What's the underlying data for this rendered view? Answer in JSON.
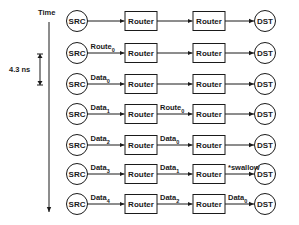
{
  "diagram": {
    "time_axis": {
      "label": "Time"
    },
    "interval": {
      "label": "4.3 ns"
    },
    "node_labels": {
      "src": "SRC",
      "router": "Router",
      "dst": "DST"
    },
    "rows": [
      {
        "edges": [
          {
            "label": "",
            "sub": ""
          },
          {
            "label": "",
            "sub": ""
          },
          {
            "label": "",
            "sub": ""
          }
        ]
      },
      {
        "edges": [
          {
            "label": "Route",
            "sub": "0"
          },
          {
            "label": "",
            "sub": ""
          },
          {
            "label": "",
            "sub": ""
          }
        ]
      },
      {
        "edges": [
          {
            "label": "Data",
            "sub": "0"
          },
          {
            "label": "",
            "sub": ""
          },
          {
            "label": "",
            "sub": ""
          }
        ]
      },
      {
        "edges": [
          {
            "label": "Data",
            "sub": "1"
          },
          {
            "label": "Route",
            "sub": "0"
          },
          {
            "label": "",
            "sub": ""
          }
        ]
      },
      {
        "edges": [
          {
            "label": "Data",
            "sub": "2"
          },
          {
            "label": "Data",
            "sub": "0"
          },
          {
            "label": "",
            "sub": ""
          }
        ]
      },
      {
        "edges": [
          {
            "label": "Data",
            "sub": "3"
          },
          {
            "label": "Data",
            "sub": "1"
          },
          {
            "label": "*swallow",
            "sub": ""
          }
        ]
      },
      {
        "edges": [
          {
            "label": "Data",
            "sub": "4"
          },
          {
            "label": "Data",
            "sub": "2"
          },
          {
            "label": "Data",
            "sub": "0"
          }
        ]
      }
    ]
  }
}
